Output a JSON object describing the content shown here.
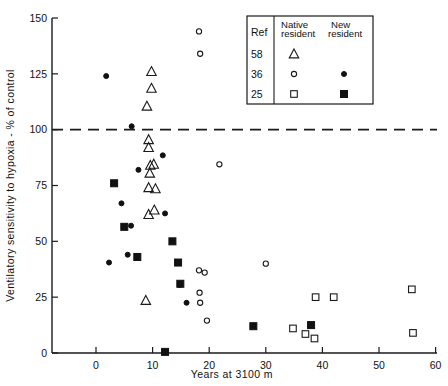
{
  "chart_data": {
    "type": "scatter",
    "title": "",
    "xlabel": "Years at 3100 m",
    "ylabel": "Ventilatory sensitivity to hypoxia - % of control",
    "xlim": [
      -8,
      60
    ],
    "ylim": [
      0,
      150
    ],
    "xticks": [
      0,
      10,
      20,
      30,
      40,
      50,
      60
    ],
    "yticks": [
      0,
      25,
      50,
      75,
      100,
      125,
      150
    ],
    "xtick_labels": [
      "0",
      "10",
      "20",
      "30",
      "40",
      "50",
      "60"
    ],
    "ytick_labels": [
      "0",
      "25",
      "50",
      "75",
      "100",
      "125",
      "150"
    ],
    "grid": false,
    "reference_line": {
      "y": 100,
      "style": "dashed",
      "label": ""
    },
    "legend": {
      "position": "top-right",
      "header_ref": "Ref",
      "header_native": "Native resident",
      "header_new": "New resident",
      "header_native_line1": "Native",
      "header_native_line2": "resident",
      "header_new_line1": "New",
      "header_new_line2": "resident",
      "rows": [
        {
          "ref": "58",
          "native_marker": "open-triangle",
          "new_marker": "none"
        },
        {
          "ref": "36",
          "native_marker": "open-circle",
          "new_marker": "filled-circle"
        },
        {
          "ref": "25",
          "native_marker": "open-square",
          "new_marker": "filled-square"
        }
      ]
    },
    "series": [
      {
        "name": "Ref 58 native resident",
        "marker": "open-triangle",
        "points": [
          [
            9.8,
            126.0
          ],
          [
            9.8,
            118.5
          ],
          [
            9.0,
            110.5
          ],
          [
            9.3,
            95.5
          ],
          [
            9.3,
            92.0
          ],
          [
            9.6,
            84.0
          ],
          [
            10.2,
            84.5
          ],
          [
            9.5,
            80.5
          ],
          [
            9.3,
            74.0
          ],
          [
            10.5,
            73.5
          ],
          [
            9.3,
            62.0
          ],
          [
            10.3,
            64.0
          ],
          [
            8.8,
            23.5
          ]
        ]
      },
      {
        "name": "Ref 36 native resident",
        "marker": "open-circle",
        "points": [
          [
            18.2,
            144.0
          ],
          [
            18.4,
            134.0
          ],
          [
            21.8,
            84.5
          ],
          [
            18.2,
            37.0
          ],
          [
            19.2,
            36.0
          ],
          [
            18.3,
            27.0
          ],
          [
            18.4,
            22.5
          ],
          [
            19.6,
            14.5
          ],
          [
            30.0,
            40.0
          ]
        ]
      },
      {
        "name": "Ref 25 native resident",
        "marker": "open-square",
        "points": [
          [
            34.8,
            11.0
          ],
          [
            37.0,
            8.5
          ],
          [
            38.6,
            6.5
          ],
          [
            38.8,
            25.0
          ],
          [
            42.0,
            25.0
          ],
          [
            55.8,
            28.5
          ],
          [
            56.0,
            9.0
          ]
        ]
      },
      {
        "name": "Ref 36 new resident",
        "marker": "filled-circle",
        "points": [
          [
            1.8,
            124.0
          ],
          [
            6.3,
            101.5
          ],
          [
            11.8,
            88.5
          ],
          [
            7.5,
            82.0
          ],
          [
            4.5,
            67.0
          ],
          [
            12.2,
            62.5
          ],
          [
            6.2,
            57.0
          ],
          [
            5.6,
            44.0
          ],
          [
            2.3,
            40.5
          ],
          [
            16.0,
            22.5
          ],
          [
            14.8,
            30.5
          ]
        ]
      },
      {
        "name": "Ref 25 new resident",
        "marker": "filled-square",
        "points": [
          [
            3.2,
            76.0
          ],
          [
            5.0,
            56.5
          ],
          [
            7.3,
            43.0
          ],
          [
            13.5,
            50.0
          ],
          [
            14.5,
            40.5
          ],
          [
            14.9,
            31.0
          ],
          [
            27.8,
            12.0
          ],
          [
            38.0,
            12.5
          ],
          [
            12.2,
            0.5
          ]
        ]
      }
    ]
  }
}
